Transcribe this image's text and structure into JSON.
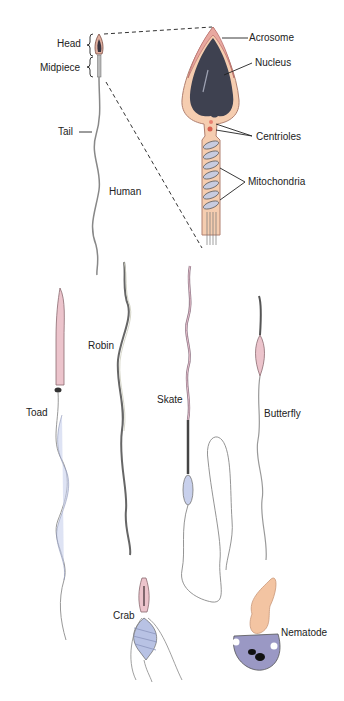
{
  "diagram": {
    "human_overview": {
      "labels": {
        "head": "Head",
        "midpiece": "Midpiece",
        "tail": "Tail",
        "species": "Human"
      }
    },
    "human_detail": {
      "labels": {
        "acrosome": "Acrosome",
        "nucleus": "Nucleus",
        "centrioles": "Centrioles",
        "mitochondria": "Mitochondria"
      }
    },
    "species": [
      {
        "name": "Toad"
      },
      {
        "name": "Robin"
      },
      {
        "name": "Skate"
      },
      {
        "name": "Butterfly"
      },
      {
        "name": "Crab"
      },
      {
        "name": "Nematode"
      }
    ],
    "colors": {
      "acrosome_pink": "#e8a8a0",
      "cytoplasm_peach": "#f5cdb0",
      "nucleus_slate": "#3e4150",
      "mitochondria_lavender": "#c8cce0",
      "tail_gray": "#888888",
      "flagellum_blue": "#c8d0ec",
      "nematode_purple": "#9a98c4"
    }
  }
}
